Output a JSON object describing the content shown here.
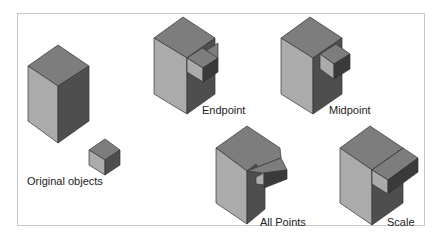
{
  "figure": {
    "labels": {
      "original": "Original objects",
      "endpoint": "Endpoint",
      "midpoint": "Midpoint",
      "all_points": "All Points",
      "scale": "Scale"
    },
    "colors": {
      "top_face": "#7d7d7d",
      "left_face": "#ababab",
      "right_face": "#4e4e4e",
      "frame": "#c8c8c8"
    }
  }
}
